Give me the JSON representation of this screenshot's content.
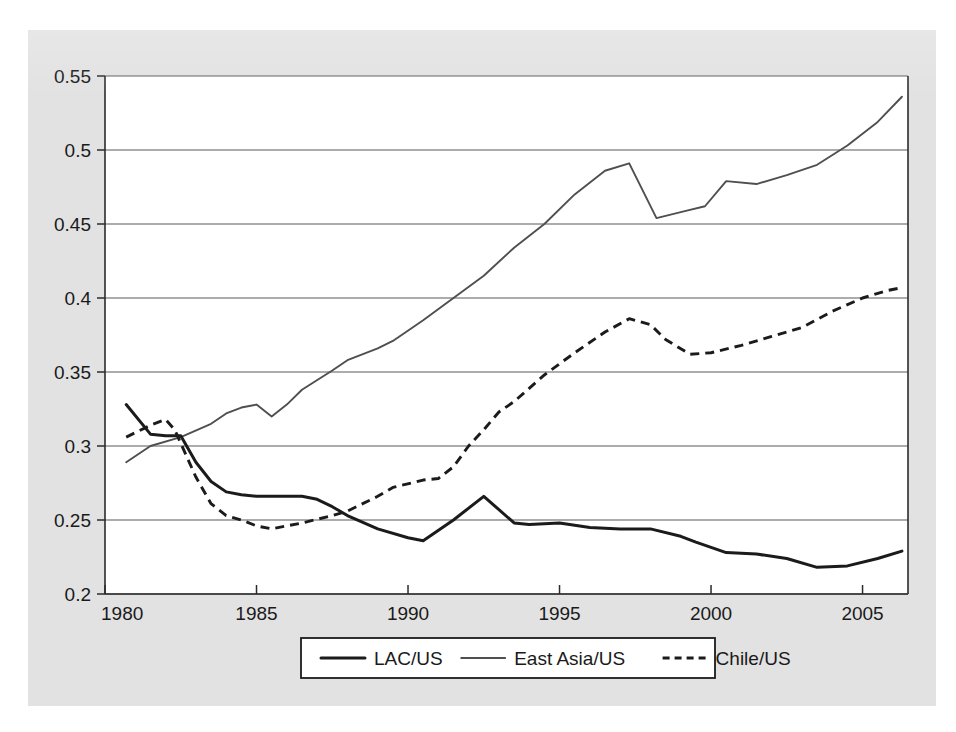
{
  "figure": {
    "background_color": "#e2e2e2",
    "plot_background_color": "#ffffff",
    "page_background_color": "#ffffff"
  },
  "axis": {
    "y_ticks": [
      "0.55",
      "0.5",
      "0.45",
      "0.4",
      "0.35",
      "0.3",
      "0.25",
      "0.2"
    ],
    "x_ticks": [
      "1980",
      "1985",
      "1990",
      "1995",
      "2000",
      "2005"
    ]
  },
  "legend": {
    "items": [
      {
        "label": "LAC/US",
        "style": "solid-thick",
        "color": "#1b1b1b"
      },
      {
        "label": "East Asia/US",
        "style": "solid-thin",
        "color": "#4f4f4f"
      },
      {
        "label": "Chile/US",
        "style": "dashed",
        "color": "#1b1b1b"
      }
    ]
  },
  "chart_data": {
    "type": "line",
    "title": "",
    "subtitle": "",
    "xlabel": "",
    "ylabel": "",
    "xlim": [
      1980,
      2006.5
    ],
    "ylim": [
      0.2,
      0.55
    ],
    "ytick_values": [
      0.55,
      0.5,
      0.45,
      0.4,
      0.35,
      0.3,
      0.25,
      0.2
    ],
    "xtick_values": [
      1980,
      1985,
      1990,
      1995,
      2000,
      2005
    ],
    "grid": "horizontal",
    "legend_position": "below-axes-center",
    "series": [
      {
        "name": "LAC/US",
        "line_style": "solid",
        "line_width": "thick",
        "color": "#1b1b1b",
        "x": [
          1980.7,
          1981.5,
          1982.0,
          1982.5,
          1983.0,
          1983.5,
          1984.0,
          1984.5,
          1985.0,
          1985.5,
          1986.0,
          1986.5,
          1987.0,
          1987.5,
          1988.0,
          1989.0,
          1990.0,
          1990.5,
          1991.5,
          1992.5,
          1993.5,
          1994.0,
          1995.0,
          1996.0,
          1997.0,
          1998.0,
          1999.0,
          1999.5,
          2000.5,
          2001.5,
          2002.5,
          2003.5,
          2004.5,
          2005.5,
          2006.3
        ],
        "y": [
          0.328,
          0.308,
          0.307,
          0.307,
          0.289,
          0.276,
          0.269,
          0.267,
          0.266,
          0.266,
          0.266,
          0.266,
          0.264,
          0.259,
          0.253,
          0.244,
          0.238,
          0.236,
          0.25,
          0.266,
          0.248,
          0.247,
          0.248,
          0.245,
          0.244,
          0.244,
          0.239,
          0.235,
          0.228,
          0.227,
          0.224,
          0.218,
          0.219,
          0.224,
          0.229
        ]
      },
      {
        "name": "East Asia/US",
        "line_style": "solid",
        "line_width": "thin",
        "color": "#4f4f4f",
        "x": [
          1980.7,
          1981.5,
          1982.5,
          1983.5,
          1984.0,
          1984.5,
          1985.0,
          1985.5,
          1986.0,
          1986.5,
          1987.5,
          1988.0,
          1989.0,
          1989.5,
          1990.5,
          1991.5,
          1992.5,
          1993.5,
          1994.5,
          1995.5,
          1996.5,
          1997.3,
          1998.2,
          1999.2,
          1999.8,
          2000.5,
          2001.5,
          2002.5,
          2003.5,
          2004.5,
          2005.5,
          2006.3
        ],
        "y": [
          0.289,
          0.3,
          0.306,
          0.315,
          0.322,
          0.326,
          0.328,
          0.32,
          0.328,
          0.338,
          0.351,
          0.358,
          0.366,
          0.371,
          0.385,
          0.4,
          0.415,
          0.434,
          0.45,
          0.47,
          0.486,
          0.491,
          0.454,
          0.459,
          0.462,
          0.479,
          0.477,
          0.483,
          0.49,
          0.503,
          0.519,
          0.536
        ]
      },
      {
        "name": "Chile/US",
        "line_style": "dashed",
        "line_width": "thick",
        "color": "#1b1b1b",
        "x": [
          1980.7,
          1981.5,
          1982.0,
          1982.3,
          1983.0,
          1983.5,
          1984.0,
          1984.5,
          1985.0,
          1985.5,
          1986.5,
          1987.5,
          1988.0,
          1989.0,
          1989.5,
          1990.5,
          1991.0,
          1991.5,
          1992.0,
          1992.5,
          1993.0,
          1993.5,
          1994.5,
          1995.5,
          1996.5,
          1997.3,
          1998.0,
          1998.5,
          1999.3,
          2000.0,
          2001.0,
          2002.0,
          2003.0,
          2004.0,
          2005.0,
          2005.8,
          2006.3
        ],
        "y": [
          0.306,
          0.314,
          0.318,
          0.311,
          0.279,
          0.261,
          0.253,
          0.25,
          0.246,
          0.244,
          0.248,
          0.253,
          0.256,
          0.266,
          0.272,
          0.277,
          0.278,
          0.286,
          0.3,
          0.311,
          0.323,
          0.33,
          0.348,
          0.363,
          0.377,
          0.386,
          0.382,
          0.372,
          0.362,
          0.363,
          0.368,
          0.374,
          0.38,
          0.391,
          0.4,
          0.405,
          0.407
        ]
      }
    ]
  }
}
